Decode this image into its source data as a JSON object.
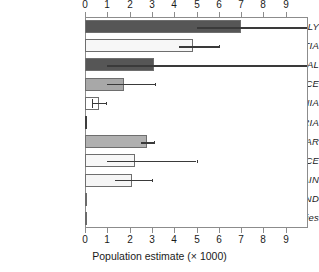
{
  "chart_data": {
    "type": "bar",
    "orientation": "horizontal",
    "title": "",
    "xlabel": "Population estimate (× 1000)",
    "ylabel": "",
    "xlim": [
      0,
      10
    ],
    "xticks": [
      0,
      1,
      2,
      3,
      4,
      5,
      6,
      7,
      8,
      9
    ],
    "xticklabels": [
      "0",
      "1",
      "2",
      "3",
      "4",
      "5",
      "6",
      "7",
      "8",
      "9"
    ],
    "grid": false,
    "legend": "none",
    "axis_top": true,
    "axis_bottom": true,
    "categories": [
      "ITALY",
      "CROATIA",
      "PORTUGAL",
      "GREECE",
      "ALBANIA",
      "BULGARIA",
      "GIBRALTAR",
      "FRANCE",
      "SPAIN",
      "SWITZERLAND",
      "Other countries"
    ],
    "values": [
      7.0,
      4.85,
      3.1,
      1.75,
      0.62,
      0.07,
      2.8,
      2.25,
      2.1,
      0.05,
      0.05
    ],
    "error_low": [
      5.0,
      4.2,
      1.0,
      1.0,
      0.3,
      null,
      2.5,
      1.0,
      1.35,
      null,
      null
    ],
    "error_high": [
      10.0,
      6.0,
      10.0,
      3.15,
      0.95,
      null,
      3.1,
      5.0,
      3.0,
      null,
      null
    ],
    "error_clipped": [
      true,
      false,
      true,
      false,
      false,
      false,
      false,
      false,
      false,
      false,
      false
    ],
    "bar_colors": [
      "#565656",
      "#f7f7f7",
      "#565656",
      "#a8a8a8",
      "#ffffff",
      "#3d3d3d",
      "#b0b0b0",
      "#f7f7f7",
      "#f5f5f5",
      "#6a6a6a",
      "#6a6a6a"
    ],
    "bar_edge_color": "#6e6e6e",
    "error_color": "#3a3a3a",
    "axis_color": "#8c8c8c",
    "text_color": "#1a1a1a",
    "background": "#ffffff"
  }
}
